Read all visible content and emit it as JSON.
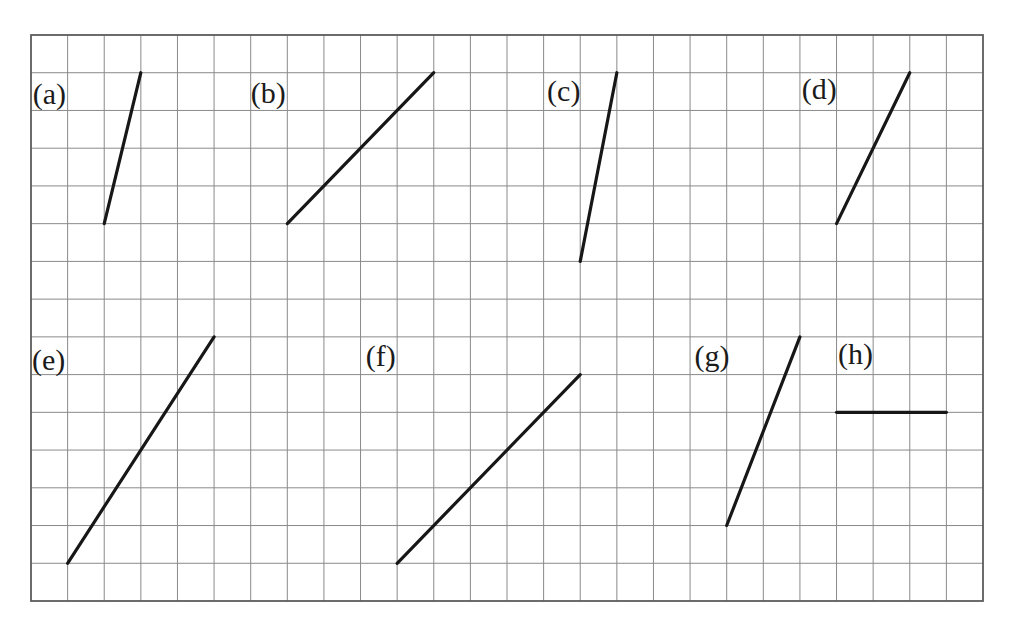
{
  "figure": {
    "grid": {
      "cols": 26,
      "rows": 15,
      "frame": {
        "left": 31,
        "top": 35,
        "right": 983,
        "bottom": 601
      }
    },
    "colors": {
      "background": "#ffffff",
      "grid_line": "#8a8a8a",
      "border": "#5c5c5c",
      "segment": "#171717",
      "label": "#1b1b1b"
    },
    "segments": [
      {
        "id": "a",
        "label": "(a)",
        "from": [
          2,
          5
        ],
        "to": [
          3,
          1
        ],
        "label_pos": [
          0.5,
          1.55
        ]
      },
      {
        "id": "b",
        "label": "(b)",
        "from": [
          7,
          5
        ],
        "to": [
          11,
          1
        ],
        "label_pos": [
          6.48,
          1.52
        ]
      },
      {
        "id": "c",
        "label": "(c)",
        "from": [
          15,
          6
        ],
        "to": [
          16,
          1
        ],
        "label_pos": [
          14.55,
          1.47
        ]
      },
      {
        "id": "d",
        "label": "(d)",
        "from": [
          22,
          5
        ],
        "to": [
          24,
          1
        ],
        "label_pos": [
          21.53,
          1.42
        ]
      },
      {
        "id": "e",
        "label": "(e)",
        "from": [
          1,
          14
        ],
        "to": [
          5,
          8
        ],
        "label_pos": [
          0.48,
          8.6
        ]
      },
      {
        "id": "f",
        "label": "(f)",
        "from": [
          10,
          14
        ],
        "to": [
          15,
          9
        ],
        "label_pos": [
          9.55,
          8.5
        ]
      },
      {
        "id": "g",
        "label": "(g)",
        "from": [
          19,
          13
        ],
        "to": [
          21,
          8
        ],
        "label_pos": [
          18.6,
          8.5
        ]
      },
      {
        "id": "h",
        "label": "(h)",
        "from": [
          22,
          10
        ],
        "to": [
          25,
          10
        ],
        "label_pos": [
          22.52,
          8.45
        ]
      }
    ]
  }
}
